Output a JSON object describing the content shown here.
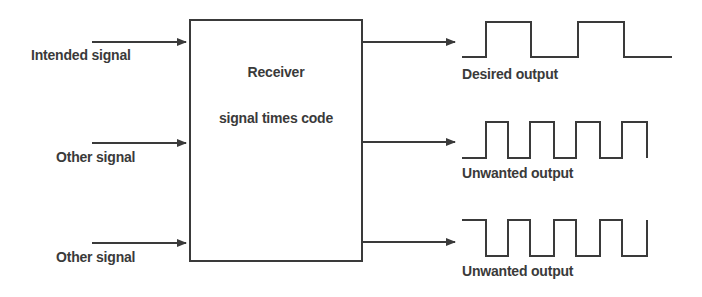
{
  "diagram": {
    "receiver": {
      "title": "Receiver",
      "subtitle": "signal times code"
    },
    "inputs": [
      {
        "label": "Intended signal"
      },
      {
        "label": "Other signal"
      },
      {
        "label": "Other signal"
      }
    ],
    "outputs": [
      {
        "label": "Desired output",
        "waveform": "slow-square-wave"
      },
      {
        "label": "Unwanted output",
        "waveform": "fast-square-wave"
      },
      {
        "label": "Unwanted output",
        "waveform": "fast-square-wave-inverted"
      }
    ],
    "colors": {
      "line": "#3a3a3a",
      "background": "#ffffff"
    }
  }
}
